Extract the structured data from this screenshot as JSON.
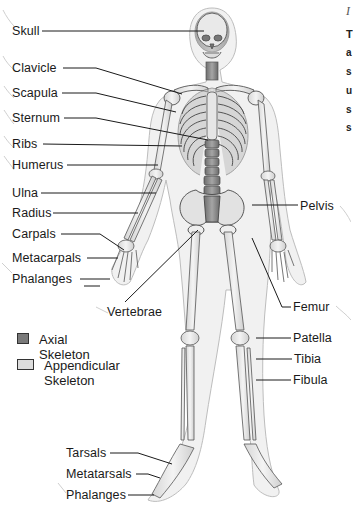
{
  "figure": {
    "type": "labeled anatomical diagram"
  },
  "labels_left": [
    {
      "id": "skull",
      "text": "Skull",
      "x": 12,
      "y": 24
    },
    {
      "id": "clavicle",
      "text": "Clavicle",
      "x": 12,
      "y": 61
    },
    {
      "id": "scapula",
      "text": "Scapula",
      "x": 12,
      "y": 86
    },
    {
      "id": "sternum",
      "text": "Sternum",
      "x": 12,
      "y": 111
    },
    {
      "id": "ribs",
      "text": "Ribs",
      "x": 12,
      "y": 137
    },
    {
      "id": "humerus",
      "text": "Humerus",
      "x": 12,
      "y": 158
    },
    {
      "id": "ulna",
      "text": "Ulna",
      "x": 12,
      "y": 186
    },
    {
      "id": "radius",
      "text": "Radius",
      "x": 12,
      "y": 206
    },
    {
      "id": "carpals",
      "text": "Carpals",
      "x": 12,
      "y": 227
    },
    {
      "id": "metacarpals",
      "text": "Metacarpals",
      "x": 12,
      "y": 251
    },
    {
      "id": "phalanges-hand",
      "text": "Phalanges",
      "x": 12,
      "y": 272
    },
    {
      "id": "vertebrae",
      "text": "Vertebrae",
      "x": 107,
      "y": 305
    },
    {
      "id": "tarsals",
      "text": "Tarsals",
      "x": 66,
      "y": 446
    },
    {
      "id": "metatarsals",
      "text": "Metatarsals",
      "x": 66,
      "y": 467
    },
    {
      "id": "phalanges-foot",
      "text": "Phalanges",
      "x": 66,
      "y": 488
    }
  ],
  "labels_right": [
    {
      "id": "pelvis",
      "text": "Pelvis",
      "x": 300,
      "y": 201
    },
    {
      "id": "femur",
      "text": "Femur",
      "x": 293,
      "y": 300
    },
    {
      "id": "patella",
      "text": "Patella",
      "x": 293,
      "y": 331
    },
    {
      "id": "tibia",
      "text": "Tibia",
      "x": 294,
      "y": 352
    },
    {
      "id": "fibula",
      "text": "Fibula",
      "x": 293,
      "y": 373
    }
  ],
  "legend": {
    "items": [
      {
        "label": "Axial Skeleton",
        "swatch_color": "#7a7a7a"
      },
      {
        "label": "Appendicular\nSkeleton",
        "label_line1": "Appendicular",
        "label_line2": "Skeleton",
        "swatch_color": "#dcdcdc"
      }
    ]
  },
  "cropped_side_text": {
    "title_glyph": "I",
    "lines": [
      "T",
      "a",
      "s",
      "u",
      "s",
      "s"
    ]
  },
  "colors": {
    "background": "#ffffff",
    "leader_line": "#1a1a1a",
    "bone_outline": "#555555",
    "axial_fill": "#8a8a8a",
    "appendicular_fill": "#e6e6e6",
    "body_outline": "#bdbdbd"
  }
}
